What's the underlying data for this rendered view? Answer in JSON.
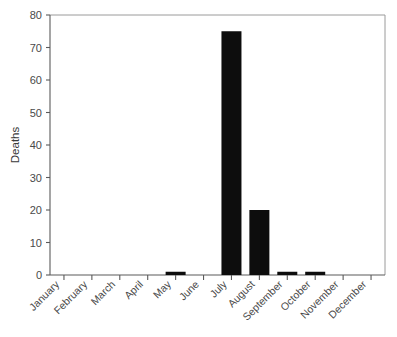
{
  "chart_data": {
    "type": "bar",
    "title": "",
    "subtitle": "",
    "xlabel": "",
    "ylabel": "Deaths",
    "categories": [
      "January",
      "February",
      "March",
      "April",
      "May",
      "June",
      "July",
      "August",
      "September",
      "October",
      "November",
      "December"
    ],
    "values": [
      0,
      0,
      0,
      0,
      1,
      0,
      75,
      20,
      1,
      1,
      0,
      0
    ],
    "series": [
      {
        "name": "Deaths",
        "values": [
          0,
          0,
          0,
          0,
          1,
          0,
          75,
          20,
          1,
          1,
          0,
          0
        ]
      }
    ],
    "ylim": [
      0,
      80
    ],
    "yticks": [
      0,
      10,
      20,
      30,
      40,
      50,
      60,
      70,
      80
    ],
    "ytick_labels": [
      "0",
      "10",
      "20",
      "30",
      "40",
      "50",
      "60",
      "70",
      "80"
    ],
    "grid": false,
    "legend": false,
    "legend_position": "none",
    "bar_color": "#0d0d0d",
    "background_color": "#ffffff",
    "frame_color": "#9a9a9a",
    "xtick_label_rotation": 45
  },
  "axes": {
    "y_axis_title": "Deaths"
  }
}
